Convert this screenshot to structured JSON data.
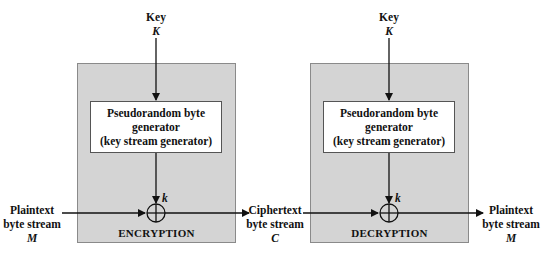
{
  "diagram": {
    "encryption": {
      "key_label": "Key",
      "key_symbol": "K",
      "generator_lines": [
        "Pseudorandom byte",
        "generator",
        "(key stream generator)"
      ],
      "keystream_symbol": "k",
      "box_label": "ENCRYPTION",
      "input": {
        "lines": [
          "Plaintext",
          "byte stream"
        ],
        "symbol": "M"
      }
    },
    "middle": {
      "lines": [
        "Ciphertext",
        "byte stream"
      ],
      "symbol": "C"
    },
    "decryption": {
      "key_label": "Key",
      "key_symbol": "K",
      "generator_lines": [
        "Pseudorandom byte",
        "generator",
        "(key stream generator)"
      ],
      "keystream_symbol": "k",
      "box_label": "DECRYPTION",
      "output": {
        "lines": [
          "Plaintext",
          "byte stream"
        ],
        "symbol": "M"
      }
    },
    "colors": {
      "box_fill": "#d4d4d4",
      "line": "#111111"
    }
  }
}
